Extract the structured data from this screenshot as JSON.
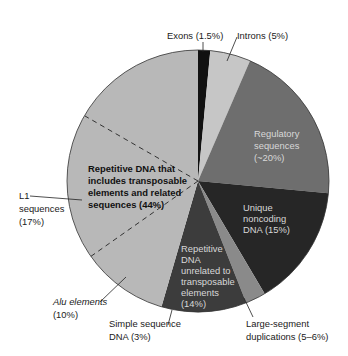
{
  "chart_data": {
    "type": "pie",
    "title": "",
    "start_angle_deg": 0,
    "direction": "clockwise",
    "slices": [
      {
        "label": "Exons (1.5%)",
        "value": 1.5,
        "color": "#111111"
      },
      {
        "label": "Introns (5%)",
        "value": 5,
        "color": "#c6c6c6"
      },
      {
        "label": "Regulatory sequences (~20%)",
        "value": 20,
        "color": "#6e6e6e"
      },
      {
        "label": "Unique noncoding DNA (15%)",
        "value": 15,
        "color": "#262626"
      },
      {
        "label": "Large-segment duplications (5–6%)",
        "value": 2.5,
        "color": "#8a8a8a"
      },
      {
        "label": "Repetitive DNA unrelated to transposable elements (14%)",
        "value": 10.5,
        "color": "#3c3c3c"
      },
      {
        "label": "Repetitive DNA that includes transposable elements and related sequences (44%)",
        "value": 45.5,
        "color": "#b8b8b8"
      }
    ],
    "sub_divisions": [
      {
        "label": "L1 sequences (17%)",
        "within": "Repetitive DNA that includes transposable elements and related sequences (44%)",
        "style": "dashed"
      },
      {
        "label": "Alu elements (10%)",
        "within": "Repetitive DNA that includes transposable elements and related sequences (44%)",
        "style": "dashed"
      },
      {
        "label": "Simple sequence DNA (3%)",
        "within": "Repetitive DNA unrelated to transposable elements (14%)"
      }
    ]
  },
  "labels": {
    "exons": "Exons (1.5%)",
    "introns": "Introns (5%)",
    "regulatory": [
      "Regulatory",
      "sequences",
      "(~20%)"
    ],
    "unique": [
      "Unique",
      "noncoding",
      "DNA (15%)"
    ],
    "rep_unrelated": [
      "Repetitive",
      "DNA",
      "unrelated to",
      "transposable",
      "elements",
      "(14%)"
    ],
    "rep_transposable": [
      "Repetitive DNA that",
      "includes transposable",
      "elements and related",
      "sequences (44%)"
    ],
    "l1": [
      "L1",
      "sequences",
      "(17%)"
    ],
    "alu": [
      "Alu elements",
      "(10%)"
    ],
    "simple": [
      "Simple sequence",
      "DNA (3%)"
    ],
    "large_seg": [
      "Large-segment",
      "duplications (5–6%)"
    ]
  }
}
